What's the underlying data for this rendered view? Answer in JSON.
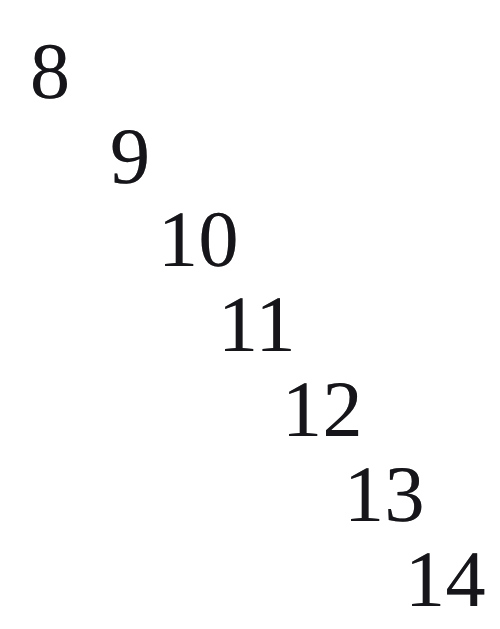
{
  "document": {
    "kind": "scanned-page-number-sequence",
    "background_color": "#ffffff",
    "ink_color": "#16161a",
    "canvas": {
      "width": 500,
      "height": 629
    },
    "caption": ""
  },
  "numerals": [
    {
      "label": "8",
      "x": 30,
      "y": 32,
      "font_size": 80
    },
    {
      "label": "9",
      "x": 110,
      "y": 117,
      "font_size": 80
    },
    {
      "label": "10",
      "x": 158,
      "y": 200,
      "font_size": 80
    },
    {
      "label": "11",
      "x": 218,
      "y": 285,
      "font_size": 80
    },
    {
      "label": "12",
      "x": 282,
      "y": 370,
      "font_size": 80
    },
    {
      "label": "13",
      "x": 344,
      "y": 455,
      "font_size": 80
    },
    {
      "label": "14",
      "x": 405,
      "y": 540,
      "font_size": 80
    }
  ]
}
